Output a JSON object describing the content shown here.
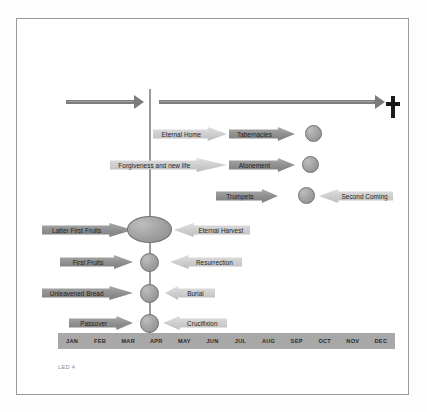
{
  "diagram": {
    "footer_code": "LED 4",
    "colors": {
      "frame_border": "#9a9a9a",
      "axis": "#9b9b9b",
      "arrow_dark": "#8f8f8f",
      "arrow_light": "#cdcdcd",
      "circle": "#9d9d9d",
      "month_bar": "#a8a8a8",
      "cross": "#1b1b1b",
      "background": "#ffffff"
    },
    "timeline_arrows": [
      {
        "name": "before-cross-arrow",
        "direction": "right"
      },
      {
        "name": "after-cross-arrow",
        "direction": "right"
      }
    ],
    "cross_symbol": "†",
    "upper_rows": [
      {
        "left_label": "Eternal Home",
        "left_style": "light",
        "right_label": "Tabernacles",
        "right_style": "dark",
        "has_circle": true
      },
      {
        "left_label": "Forgiveness and new life",
        "left_style": "light",
        "right_label": "Atonement",
        "right_style": "dark",
        "has_circle": true
      },
      {
        "left_label": "Trumpets",
        "left_style": "dark",
        "right_label": "Second Coming",
        "right_style": "light",
        "has_circle": true
      }
    ],
    "lower_rows": [
      {
        "feast": "Latter First Fruits",
        "fulfilment": "Eternal Harvest",
        "marker": "ellipse"
      },
      {
        "feast": "First Fruits",
        "fulfilment": "Resurrection",
        "marker": "circle"
      },
      {
        "feast": "Unleavened Bread",
        "fulfilment": "Burial",
        "marker": "circle"
      },
      {
        "feast": "Passover",
        "fulfilment": "Crucifixion",
        "marker": "circle"
      }
    ],
    "months": [
      "JAN",
      "FEB",
      "MAR",
      "APR",
      "MAY",
      "JUN",
      "JUL",
      "AUG",
      "SEP",
      "OCT",
      "NOV",
      "DEC"
    ]
  }
}
